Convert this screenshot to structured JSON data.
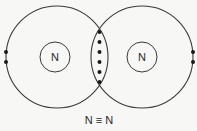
{
  "diagram": {
    "type": "dot-and-cross / Bohr shell diagram",
    "molecule": "N2",
    "atoms": [
      {
        "symbol": "N",
        "shell_center": [
          57,
          57
        ],
        "shell_radius": 50,
        "core_center": [
          55,
          57
        ],
        "core_radius": 15,
        "lone_pair": [
          [
            6,
            52
          ],
          [
            6,
            62
          ]
        ]
      },
      {
        "symbol": "N",
        "shell_center": [
          142,
          57
        ],
        "shell_radius": 50,
        "core_center": [
          142,
          57
        ],
        "core_radius": 15,
        "lone_pair": [
          [
            193,
            52
          ],
          [
            193,
            62
          ]
        ]
      }
    ],
    "shared_electrons": [
      [
        99,
        32
      ],
      [
        99,
        43
      ],
      [
        99,
        52
      ],
      [
        99,
        62
      ],
      [
        99,
        71
      ],
      [
        99,
        82
      ]
    ],
    "shared_electron_count": 6,
    "bond_formula": "N ≡ N",
    "colors": {
      "line": "#3a3a3a",
      "electron": "#1a1a1a",
      "background": "#f7f7f5"
    }
  }
}
